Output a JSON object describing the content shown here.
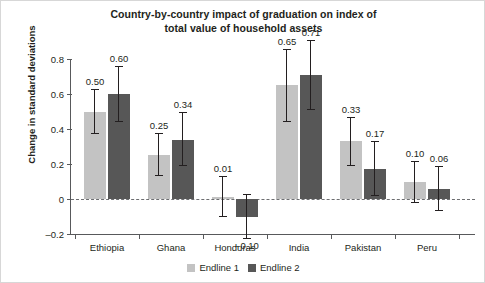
{
  "chart_data": {
    "type": "bar",
    "title": "Country-by-country impact of graduation on index of total value of household assets",
    "title_line1": "Country-by-country impact of graduation on index of",
    "title_line2": "total value of household assets",
    "xlabel": "",
    "ylabel": "Change in standard deviations",
    "ylim": [
      -0.2,
      0.8
    ],
    "yticks": [
      "0.8",
      "0.6",
      "0.4",
      "0.2",
      "0",
      "-0.2"
    ],
    "ytick_values": [
      0.8,
      0.6,
      0.4,
      0.2,
      0,
      -0.2
    ],
    "grid": false,
    "zero_line": true,
    "legend_position": "bottom",
    "categories": [
      "Ethiopia",
      "Ghana",
      "Honduras",
      "India",
      "Pakistan",
      "Peru"
    ],
    "series": [
      {
        "name": "Endline 1",
        "color": "#c3c3c3",
        "values": [
          0.5,
          0.25,
          0.01,
          0.65,
          0.33,
          0.1
        ],
        "labels": [
          "0.50",
          "0.25",
          "0.01",
          "0.65",
          "0.33",
          "0.10"
        ],
        "err_low": [
          0.37,
          0.13,
          -0.1,
          0.44,
          0.19,
          -0.02
        ],
        "err_high": [
          0.63,
          0.38,
          0.13,
          0.86,
          0.47,
          0.22
        ]
      },
      {
        "name": "Endline 2",
        "color": "#575757",
        "values": [
          0.6,
          0.34,
          -0.1,
          0.71,
          0.17,
          0.06
        ],
        "labels": [
          "0.60",
          "0.34",
          "-0.10",
          "0.71",
          "0.17",
          "0.06"
        ],
        "err_low": [
          0.44,
          0.19,
          -0.23,
          0.51,
          0.02,
          -0.07
        ],
        "err_high": [
          0.76,
          0.5,
          0.03,
          0.91,
          0.33,
          0.19
        ]
      }
    ]
  }
}
